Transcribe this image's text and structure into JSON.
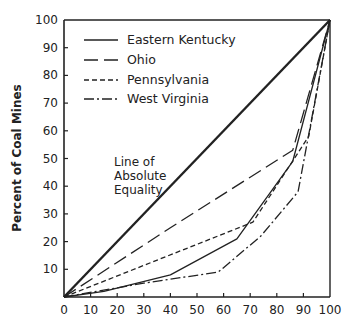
{
  "chart_data": {
    "type": "line",
    "title": "",
    "xlabel": "",
    "ylabel": "Percent of Coal Mines",
    "xlim": [
      0,
      100
    ],
    "ylim": [
      0,
      100
    ],
    "x_ticks": [
      0,
      10,
      20,
      30,
      40,
      50,
      60,
      70,
      80,
      90,
      100
    ],
    "y_ticks": [
      10,
      20,
      30,
      40,
      50,
      60,
      70,
      80,
      90,
      100
    ],
    "grid": false,
    "legend_position": "upper-left",
    "annotations": [
      {
        "lines": [
          "Line of",
          "Absolute",
          "Equality"
        ],
        "x": 16,
        "y": 52
      }
    ],
    "series": [
      {
        "name": "Line of Absolute Equality",
        "style": "thick-solid",
        "points": [
          [
            0,
            0
          ],
          [
            100,
            100
          ]
        ]
      },
      {
        "name": "Eastern Kentucky",
        "style": "solid",
        "points": [
          [
            0,
            0
          ],
          [
            15,
            2
          ],
          [
            40,
            8
          ],
          [
            65,
            21
          ],
          [
            86,
            49
          ],
          [
            100,
            100
          ]
        ]
      },
      {
        "name": "Ohio",
        "style": "long-dash",
        "points": [
          [
            0,
            0
          ],
          [
            40,
            25
          ],
          [
            86,
            53
          ],
          [
            100,
            100
          ]
        ]
      },
      {
        "name": "Pennsylvania",
        "style": "short-dash",
        "points": [
          [
            0,
            0
          ],
          [
            71,
            27
          ],
          [
            92,
            58
          ],
          [
            100,
            100
          ]
        ]
      },
      {
        "name": "West Virginia",
        "style": "dash-dot",
        "points": [
          [
            0,
            0
          ],
          [
            30,
            5
          ],
          [
            58,
            9
          ],
          [
            74,
            22
          ],
          [
            88,
            38
          ],
          [
            100,
            100
          ]
        ]
      }
    ]
  },
  "legend": {
    "items": [
      {
        "label": "Eastern Kentucky"
      },
      {
        "label": "Ohio"
      },
      {
        "label": "Pennsylvania"
      },
      {
        "label": "West Virginia"
      }
    ]
  },
  "annotation": {
    "line1": "Line of",
    "line2": "Absolute",
    "line3": "Equality"
  },
  "axes": {
    "ylabel": "Percent of Coal Mines",
    "x_tick_labels": [
      "0",
      "10",
      "20",
      "30",
      "40",
      "50",
      "60",
      "70",
      "80",
      "90",
      "100"
    ],
    "y_tick_labels": [
      "10",
      "20",
      "30",
      "40",
      "50",
      "60",
      "70",
      "80",
      "90",
      "100"
    ]
  }
}
